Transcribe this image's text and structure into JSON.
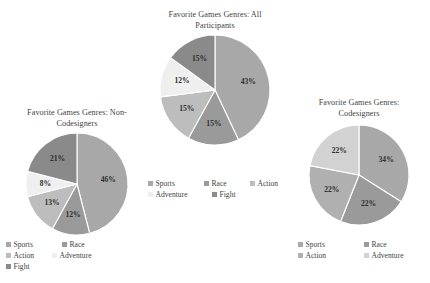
{
  "chart_data": [
    {
      "id": "all",
      "type": "pie",
      "title": "Favorite Games Genres: All Participants",
      "title_lines": [
        "Favorite Games Genres: All",
        "Participants"
      ],
      "categories": [
        "Sports",
        "Race",
        "Action",
        "Adventure",
        "Fight"
      ],
      "values": [
        43,
        15,
        15,
        12,
        15
      ],
      "labels": [
        "43%",
        "15%",
        "15%",
        "12%",
        "15%"
      ],
      "colors": [
        "#a8a8a8",
        "#9a9a9a",
        "#bdbdbd",
        "#efefef",
        "#8a8a8a"
      ],
      "legend_position": "below",
      "grid": false
    },
    {
      "id": "non_codesigners",
      "type": "pie",
      "title": "Favorite Games Genres: Non-Codesigners",
      "title_lines": [
        "Favorite Games Genres: Non-",
        "Codesigners"
      ],
      "categories": [
        "Sports",
        "Race",
        "Action",
        "Adventure",
        "Fight"
      ],
      "values": [
        46,
        12,
        13,
        8,
        21
      ],
      "labels": [
        "46%",
        "12%",
        "13%",
        "8%",
        "21%"
      ],
      "colors": [
        "#a8a8a8",
        "#9a9a9a",
        "#bdbdbd",
        "#efefef",
        "#8a8a8a"
      ],
      "legend_position": "below",
      "grid": false
    },
    {
      "id": "codesigners",
      "type": "pie",
      "title": "Favorite Games Genres: Codesigners",
      "title_lines": [
        "Favorite Games Genres:",
        "Codesigners"
      ],
      "categories": [
        "Sports",
        "Race",
        "Action",
        "Adventure"
      ],
      "values": [
        34,
        22,
        22,
        22
      ],
      "labels": [
        "34%",
        "22%",
        "22%",
        "22%"
      ],
      "colors": [
        "#a8a8a8",
        "#9a9a9a",
        "#b0b0b0",
        "#d2d2d2"
      ],
      "legend_position": "below",
      "grid": false
    }
  ],
  "charts": {
    "all": {
      "title_line1": "Favorite Games Genres: All",
      "title_line2": "Participants",
      "slices": [
        {
          "label": "43%",
          "category": "Sports",
          "value": 43,
          "color": "#a8a8a8"
        },
        {
          "label": "15%",
          "category": "Race",
          "value": 15,
          "color": "#9a9a9a"
        },
        {
          "label": "15%",
          "category": "Action",
          "value": 15,
          "color": "#bdbdbd"
        },
        {
          "label": "12%",
          "category": "Adventure",
          "value": 12,
          "color": "#efefef"
        },
        {
          "label": "15%",
          "category": "Fight",
          "value": 15,
          "color": "#8a8a8a"
        }
      ],
      "legend": [
        {
          "label": "Sports",
          "color": "#a8a8a8"
        },
        {
          "label": "Race",
          "color": "#9a9a9a"
        },
        {
          "label": "Action",
          "color": "#bdbdbd"
        },
        {
          "label": "Adventure",
          "color": "#efefef"
        },
        {
          "label": "Fight",
          "color": "#8a8a8a"
        }
      ]
    },
    "non_codesigners": {
      "title_line1": "Favorite Games Genres: Non-",
      "title_line2": "Codesigners",
      "slices": [
        {
          "label": "46%",
          "category": "Sports",
          "value": 46,
          "color": "#a8a8a8"
        },
        {
          "label": "12%",
          "category": "Race",
          "value": 12,
          "color": "#9a9a9a"
        },
        {
          "label": "13%",
          "category": "Action",
          "value": 13,
          "color": "#bdbdbd"
        },
        {
          "label": "8%",
          "category": "Adventure",
          "value": 8,
          "color": "#efefef"
        },
        {
          "label": "21%",
          "category": "Fight",
          "value": 21,
          "color": "#8a8a8a"
        }
      ],
      "legend": [
        {
          "label": "Sports",
          "color": "#a8a8a8"
        },
        {
          "label": "Race",
          "color": "#9a9a9a"
        },
        {
          "label": "Action",
          "color": "#bdbdbd"
        },
        {
          "label": "Adventure",
          "color": "#efefef"
        },
        {
          "label": "Fight",
          "color": "#8a8a8a"
        }
      ]
    },
    "codesigners": {
      "title_line1": "Favorite Games Genres:",
      "title_line2": "Codesigners",
      "slices": [
        {
          "label": "34%",
          "category": "Sports",
          "value": 34,
          "color": "#a8a8a8"
        },
        {
          "label": "22%",
          "category": "Race",
          "value": 22,
          "color": "#9a9a9a"
        },
        {
          "label": "22%",
          "category": "Action",
          "value": 22,
          "color": "#b0b0b0"
        },
        {
          "label": "22%",
          "category": "Adventure",
          "value": 22,
          "color": "#d2d2d2"
        }
      ],
      "legend": [
        {
          "label": "Sports",
          "color": "#a8a8a8"
        },
        {
          "label": "Race",
          "color": "#9a9a9a"
        },
        {
          "label": "Action",
          "color": "#b0b0b0"
        },
        {
          "label": "Adventure",
          "color": "#d2d2d2"
        }
      ]
    }
  }
}
